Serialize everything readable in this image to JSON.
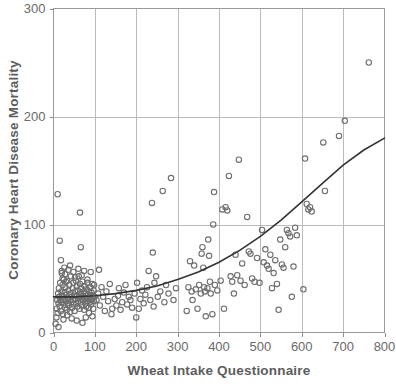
{
  "chart_data": {
    "type": "scatter",
    "title": "",
    "xlabel": "Wheat Intake Questionnaire",
    "ylabel": "Coronary Heart Disease Mortality",
    "xlim": [
      0,
      800
    ],
    "ylim": [
      0,
      300
    ],
    "xticks": [
      0,
      100,
      200,
      300,
      400,
      500,
      600,
      700,
      800
    ],
    "yticks": [
      0,
      100,
      200,
      300
    ],
    "xtick_labels": [
      "0",
      "100",
      "200",
      "300",
      "400",
      "500",
      "600",
      "700",
      "800"
    ],
    "ytick_labels": [
      "0",
      "100",
      "200",
      "300"
    ],
    "grid": true,
    "grid_color": "#bcbcbc",
    "legend": null,
    "marker": "open-circle",
    "marker_color": "#6e6e6e",
    "trend_color": "#333333",
    "series": [
      {
        "name": "Observations",
        "points": [
          [
            5,
            8
          ],
          [
            7,
            14
          ],
          [
            8,
            22
          ],
          [
            9,
            30
          ],
          [
            10,
            18
          ],
          [
            11,
            36
          ],
          [
            12,
            27
          ],
          [
            13,
            41
          ],
          [
            14,
            33
          ],
          [
            15,
            24
          ],
          [
            16,
            46
          ],
          [
            17,
            30
          ],
          [
            18,
            20
          ],
          [
            19,
            38
          ],
          [
            20,
            28
          ],
          [
            20,
            55
          ],
          [
            21,
            34
          ],
          [
            22,
            44
          ],
          [
            23,
            17
          ],
          [
            24,
            31
          ],
          [
            25,
            49
          ],
          [
            26,
            26
          ],
          [
            27,
            37
          ],
          [
            28,
            23
          ],
          [
            29,
            42
          ],
          [
            30,
            29
          ],
          [
            31,
            35
          ],
          [
            32,
            21
          ],
          [
            33,
            48
          ],
          [
            34,
            32
          ],
          [
            35,
            27
          ],
          [
            36,
            39
          ],
          [
            37,
            25
          ],
          [
            38,
            44
          ],
          [
            39,
            30
          ],
          [
            40,
            19
          ],
          [
            41,
            36
          ],
          [
            42,
            52
          ],
          [
            43,
            28
          ],
          [
            44,
            33
          ],
          [
            45,
            23
          ],
          [
            46,
            41
          ],
          [
            47,
            30
          ],
          [
            48,
            46
          ],
          [
            49,
            26
          ],
          [
            50,
            35
          ],
          [
            51,
            20
          ],
          [
            52,
            38
          ],
          [
            53,
            31
          ],
          [
            54,
            48
          ],
          [
            55,
            27
          ],
          [
            56,
            43
          ],
          [
            57,
            34
          ],
          [
            58,
            24
          ],
          [
            59,
            39
          ],
          [
            60,
            29
          ],
          [
            61,
            52
          ],
          [
            62,
            33
          ],
          [
            63,
            22
          ],
          [
            64,
            45
          ],
          [
            65,
            36
          ],
          [
            66,
            28
          ],
          [
            67,
            41
          ],
          [
            68,
            31
          ],
          [
            69,
            25
          ],
          [
            70,
            47
          ],
          [
            71,
            34
          ],
          [
            72,
            30
          ],
          [
            73,
            38
          ],
          [
            74,
            21
          ],
          [
            75,
            43
          ],
          [
            76,
            32
          ],
          [
            77,
            27
          ],
          [
            78,
            36
          ],
          [
            79,
            24
          ],
          [
            80,
            40
          ],
          [
            81,
            31
          ],
          [
            82,
            46
          ],
          [
            83,
            29
          ],
          [
            84,
            35
          ],
          [
            85,
            23
          ],
          [
            86,
            38
          ],
          [
            87,
            33
          ],
          [
            88,
            28
          ],
          [
            89,
            42
          ],
          [
            90,
            30
          ],
          [
            91,
            26
          ],
          [
            92,
            37
          ],
          [
            93,
            31
          ],
          [
            94,
            45
          ],
          [
            95,
            34
          ],
          [
            96,
            22
          ],
          [
            97,
            39
          ],
          [
            98,
            29
          ],
          [
            99,
            33
          ],
          [
            10,
            128
          ],
          [
            12,
            5
          ],
          [
            15,
            85
          ],
          [
            18,
            67
          ],
          [
            20,
            57
          ],
          [
            22,
            50
          ],
          [
            24,
            12
          ],
          [
            26,
            60
          ],
          [
            28,
            54
          ],
          [
            30,
            47
          ],
          [
            33,
            16
          ],
          [
            36,
            58
          ],
          [
            40,
            62
          ],
          [
            44,
            13
          ],
          [
            48,
            56
          ],
          [
            52,
            51
          ],
          [
            56,
            11
          ],
          [
            60,
            59
          ],
          [
            64,
            111
          ],
          [
            66,
            79
          ],
          [
            68,
            53
          ],
          [
            70,
            9
          ],
          [
            74,
            57
          ],
          [
            78,
            14
          ],
          [
            82,
            49
          ],
          [
            86,
            18
          ],
          [
            90,
            56
          ],
          [
            94,
            15
          ],
          [
            98,
            44
          ],
          [
            104,
            30
          ],
          [
            108,
            36
          ],
          [
            110,
            58
          ],
          [
            112,
            25
          ],
          [
            116,
            42
          ],
          [
            120,
            33
          ],
          [
            124,
            20
          ],
          [
            128,
            38
          ],
          [
            132,
            29
          ],
          [
            136,
            45
          ],
          [
            140,
            17
          ],
          [
            142,
            22
          ],
          [
            148,
            31
          ],
          [
            152,
            25
          ],
          [
            156,
            34
          ],
          [
            158,
            41
          ],
          [
            162,
            21
          ],
          [
            166,
            28
          ],
          [
            170,
            37
          ],
          [
            174,
            44
          ],
          [
            178,
            26
          ],
          [
            182,
            33
          ],
          [
            186,
            30
          ],
          [
            190,
            23
          ],
          [
            196,
            36
          ],
          [
            200,
            14
          ],
          [
            202,
            46
          ],
          [
            206,
            22
          ],
          [
            210,
            31
          ],
          [
            214,
            39
          ],
          [
            218,
            27
          ],
          [
            222,
            35
          ],
          [
            226,
            42
          ],
          [
            230,
            57
          ],
          [
            234,
            30
          ],
          [
            238,
            120
          ],
          [
            240,
            74
          ],
          [
            242,
            24
          ],
          [
            244,
            46
          ],
          [
            248,
            52
          ],
          [
            252,
            33
          ],
          [
            258,
            38
          ],
          [
            264,
            131
          ],
          [
            268,
            28
          ],
          [
            272,
            44
          ],
          [
            278,
            36
          ],
          [
            284,
            143
          ],
          [
            290,
            30
          ],
          [
            296,
            41
          ],
          [
            322,
            20
          ],
          [
            326,
            42
          ],
          [
            330,
            66
          ],
          [
            334,
            38
          ],
          [
            336,
            30
          ],
          [
            340,
            62
          ],
          [
            344,
            40
          ],
          [
            348,
            22
          ],
          [
            352,
            44
          ],
          [
            356,
            36
          ],
          [
            358,
            73
          ],
          [
            360,
            79
          ],
          [
            362,
            60
          ],
          [
            364,
            42
          ],
          [
            366,
            38
          ],
          [
            368,
            15
          ],
          [
            372,
            41
          ],
          [
            374,
            86
          ],
          [
            376,
            71
          ],
          [
            378,
            47
          ],
          [
            380,
            36
          ],
          [
            384,
            17
          ],
          [
            386,
            100
          ],
          [
            388,
            130
          ],
          [
            390,
            44
          ],
          [
            396,
            39
          ],
          [
            404,
            48
          ],
          [
            408,
            114
          ],
          [
            412,
            22
          ],
          [
            416,
            116
          ],
          [
            420,
            113
          ],
          [
            424,
            145
          ],
          [
            428,
            52
          ],
          [
            432,
            47
          ],
          [
            436,
            36
          ],
          [
            440,
            72
          ],
          [
            444,
            53
          ],
          [
            448,
            160
          ],
          [
            452,
            48
          ],
          [
            456,
            64
          ],
          [
            462,
            44
          ],
          [
            468,
            107
          ],
          [
            472,
            75
          ],
          [
            476,
            73
          ],
          [
            480,
            50
          ],
          [
            486,
            47
          ],
          [
            492,
            69
          ],
          [
            498,
            46
          ],
          [
            504,
            95
          ],
          [
            508,
            65
          ],
          [
            512,
            77
          ],
          [
            516,
            62
          ],
          [
            520,
            59
          ],
          [
            524,
            72
          ],
          [
            528,
            41
          ],
          [
            532,
            55
          ],
          [
            536,
            67
          ],
          [
            540,
            45
          ],
          [
            544,
            21
          ],
          [
            548,
            86
          ],
          [
            552,
            63
          ],
          [
            556,
            60
          ],
          [
            560,
            79
          ],
          [
            564,
            95
          ],
          [
            568,
            92
          ],
          [
            572,
            89
          ],
          [
            576,
            33
          ],
          [
            580,
            61
          ],
          [
            584,
            97
          ],
          [
            588,
            90
          ],
          [
            604,
            40
          ],
          [
            608,
            161
          ],
          [
            612,
            119
          ],
          [
            616,
            114
          ],
          [
            620,
            116
          ],
          [
            624,
            112
          ],
          [
            652,
            176
          ],
          [
            656,
            131
          ],
          [
            690,
            182
          ],
          [
            704,
            196
          ],
          [
            762,
            250
          ]
        ]
      }
    ],
    "trend_line": {
      "name": "Fitted curve",
      "points": [
        [
          0,
          33
        ],
        [
          50,
          33
        ],
        [
          100,
          34
        ],
        [
          150,
          36
        ],
        [
          200,
          39
        ],
        [
          250,
          43
        ],
        [
          300,
          49
        ],
        [
          350,
          56
        ],
        [
          400,
          65
        ],
        [
          450,
          76
        ],
        [
          500,
          89
        ],
        [
          550,
          104
        ],
        [
          600,
          121
        ],
        [
          650,
          138
        ],
        [
          700,
          155
        ],
        [
          750,
          169
        ],
        [
          800,
          180
        ]
      ]
    }
  },
  "axes": {
    "x_title": "Wheat Intake Questionnaire",
    "y_title": "Coronary Heart Disease Mortality"
  }
}
